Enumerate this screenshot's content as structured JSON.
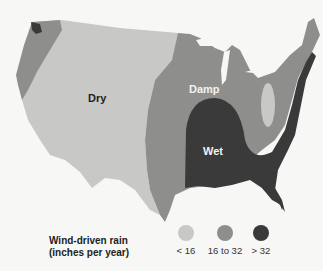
{
  "map": {
    "title": "Wind-driven rain across the contiguous United States",
    "regions": [
      {
        "name": "dry",
        "label": "Dry",
        "color": "#c8c8c6"
      },
      {
        "name": "damp",
        "label": "Damp",
        "color": "#8e8e8c"
      },
      {
        "name": "wet",
        "label": "Wet",
        "color": "#3a3a3a"
      }
    ]
  },
  "legend": {
    "title_line1": "Wind-driven rain",
    "title_line2": "(inches per year)",
    "items": [
      {
        "label": "< 16",
        "color": "#c8c8c6"
      },
      {
        "label": "16 to 32",
        "color": "#8e8e8c"
      },
      {
        "label": "> 32",
        "color": "#3a3a3a"
      }
    ]
  }
}
